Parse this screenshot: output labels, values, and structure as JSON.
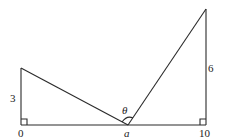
{
  "diagram": {
    "labels": {
      "left_height": "3",
      "right_height": "6",
      "origin": "0",
      "end": "10",
      "point": "a",
      "angle": "θ"
    },
    "geometry": {
      "baseline": {
        "from": 0,
        "to": 10
      },
      "left_vertical_height": 3,
      "right_vertical_height": 6,
      "apex_point": "a",
      "right_angles": [
        "at 0",
        "at 10"
      ]
    },
    "colors": {
      "stroke": "#2a2a2a",
      "background": "#ffffff"
    }
  }
}
